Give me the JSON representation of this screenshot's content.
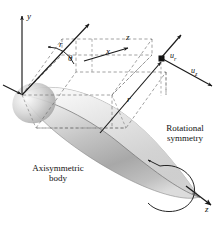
{
  "figure": {
    "background_color": "#ffffff",
    "line_color": "#1a1a1a",
    "dashed_color": "#6b6b6b",
    "body_fill_light": "#f2f2f2",
    "body_fill_mid": "#c9c9c9",
    "body_fill_dark": "#8f8f8f"
  },
  "axes": {
    "y_label": "y",
    "x_label": "x",
    "z_label": "z",
    "z_axis_label": "z"
  },
  "coordinates": {
    "radius_upper_label": "r",
    "radius_lower_label": "r",
    "theta_label": "θ"
  },
  "velocity": {
    "radial_symbol": "u",
    "radial_subscript": "r",
    "axial_symbol": "u",
    "axial_subscript": "z"
  },
  "captions": {
    "axisymmetric_line1": "Axisymmetric",
    "axisymmetric_line2": "body",
    "rotational_line1": "Rotational",
    "rotational_line2": "symmetry"
  }
}
